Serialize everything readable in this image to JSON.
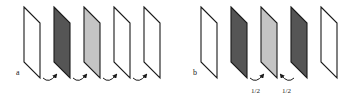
{
  "panels": [
    {
      "label": "a",
      "label_pos": [
        16,
        76
      ],
      "panes": [
        {
          "x": 24,
          "fill": "#ffffff"
        },
        {
          "x": 54,
          "fill": "#555555"
        },
        {
          "x": 84,
          "fill": "#c4c4c4"
        },
        {
          "x": 114,
          "fill": "#ffffff"
        },
        {
          "x": 144,
          "fill": "#ffffff"
        }
      ],
      "arrows": [
        {
          "x": 43,
          "dir": "right",
          "label": ""
        },
        {
          "x": 73,
          "dir": "right",
          "label": ""
        },
        {
          "x": 103,
          "dir": "right",
          "label": ""
        },
        {
          "x": 133,
          "dir": "right",
          "label": ""
        }
      ]
    },
    {
      "label": "b",
      "label_pos": [
        193,
        76
      ],
      "panes": [
        {
          "x": 201,
          "fill": "#ffffff"
        },
        {
          "x": 231,
          "fill": "#555555"
        },
        {
          "x": 261,
          "fill": "#c4c4c4"
        },
        {
          "x": 291,
          "fill": "#555555"
        },
        {
          "x": 321,
          "fill": "#ffffff"
        }
      ],
      "arrows": [
        {
          "x": 250,
          "dir": "right",
          "label": "1/2"
        },
        {
          "x": 281,
          "dir": "left",
          "label": "1/2"
        }
      ]
    }
  ],
  "style": {
    "stroke": "#1a1a1a",
    "pane_top": 7,
    "pane_width": 16,
    "pane_height": 55,
    "pane_skew": 16,
    "arrow_y": 80
  }
}
